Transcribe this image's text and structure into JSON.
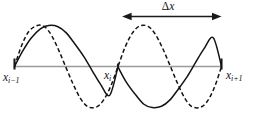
{
  "figure": {
    "name": "sampling-aliasing-diagram",
    "background_color": "#ffffff",
    "axis_color": "#9a9a9a",
    "curve_color": "#141414",
    "labels": {
      "left_node": {
        "base": "x",
        "sub": "i−1"
      },
      "center_node": {
        "base": "x",
        "sub": "i"
      },
      "right_node": {
        "base": "x",
        "sub": "i+1"
      },
      "span": {
        "symbol": "Δ",
        "variable": "x"
      }
    }
  },
  "chart_data": {
    "type": "line",
    "title": "",
    "xlabel": "",
    "ylabel": "",
    "grid": false,
    "legend": null,
    "xlim": [
      0,
      2
    ],
    "ylim": [
      -1.25,
      1.25
    ],
    "baseline_y": 0,
    "x_ticks": [
      0,
      1,
      2
    ],
    "x_tick_labels": [
      "x_{i-1}",
      "x_i",
      "x_{i+1}"
    ],
    "annotations": [
      {
        "name": "delta-x-span",
        "text": "Δx",
        "kind": "double-headed-arrow",
        "x_start": 1.04,
        "x_end": 2.0,
        "y": 1.22
      }
    ],
    "series": [
      {
        "name": "solid-wave",
        "style": "solid",
        "periods": 1.0,
        "amplitude": 1.0,
        "phase_deg": 0,
        "points": [
          [
            0.0,
            0.0
          ],
          [
            0.08,
            0.38
          ],
          [
            0.16,
            0.69
          ],
          [
            0.25,
            0.92
          ],
          [
            0.33,
            1.0
          ],
          [
            0.42,
            0.97
          ],
          [
            0.5,
            0.82
          ],
          [
            0.58,
            0.56
          ],
          [
            0.67,
            0.24
          ],
          [
            0.75,
            -0.1
          ],
          [
            0.83,
            -0.43
          ],
          [
            0.92,
            -0.7
          ],
          [
            1.0,
            0.0
          ],
          [
            1.0,
            -0.01
          ],
          [
            1.08,
            -0.38
          ],
          [
            1.17,
            -0.69
          ],
          [
            1.25,
            -0.92
          ],
          [
            1.33,
            -1.0
          ],
          [
            1.42,
            -0.97
          ],
          [
            1.5,
            -0.82
          ],
          [
            1.58,
            -0.56
          ],
          [
            1.67,
            -0.24
          ],
          [
            1.75,
            0.1
          ],
          [
            1.83,
            0.43
          ],
          [
            1.92,
            0.7
          ],
          [
            2.0,
            0.0
          ]
        ]
      },
      {
        "name": "dashed-wave",
        "style": "dashed",
        "periods": 1.5,
        "amplitude": 1.0,
        "phase_deg": 0,
        "points": [
          [
            0.0,
            0.0
          ],
          [
            0.07,
            0.52
          ],
          [
            0.14,
            0.86
          ],
          [
            0.22,
            1.0
          ],
          [
            0.29,
            0.97
          ],
          [
            0.36,
            0.75
          ],
          [
            0.43,
            0.38
          ],
          [
            0.5,
            -0.04
          ],
          [
            0.57,
            -0.45
          ],
          [
            0.64,
            -0.79
          ],
          [
            0.71,
            -0.98
          ],
          [
            0.79,
            -0.99
          ],
          [
            0.86,
            -0.82
          ],
          [
            0.93,
            -0.48
          ],
          [
            1.0,
            0.0
          ],
          [
            1.07,
            0.48
          ],
          [
            1.14,
            0.82
          ],
          [
            1.21,
            0.99
          ],
          [
            1.29,
            0.98
          ],
          [
            1.36,
            0.79
          ],
          [
            1.43,
            0.45
          ],
          [
            1.5,
            0.04
          ],
          [
            1.57,
            -0.38
          ],
          [
            1.64,
            -0.75
          ],
          [
            1.71,
            -0.97
          ],
          [
            1.79,
            -1.0
          ],
          [
            1.86,
            -0.86
          ],
          [
            1.93,
            -0.52
          ],
          [
            2.0,
            0.0
          ]
        ]
      }
    ]
  }
}
